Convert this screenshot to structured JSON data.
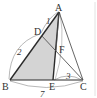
{
  "diagram": {
    "type": "geometry-triangle",
    "colors": {
      "line": "#2a2a2a",
      "thin_line": "#555555",
      "shade": "#d4d4d4",
      "arc": "#9a9a9a",
      "border": "#e2e2e2"
    },
    "points": {
      "A": {
        "label": "A",
        "x": 59,
        "y": 12
      },
      "B": {
        "label": "B",
        "x": 10,
        "y": 80
      },
      "C": {
        "label": "C",
        "x": 83,
        "y": 80
      },
      "D": {
        "label": "D",
        "x": 41,
        "y": 35
      },
      "E": {
        "label": "E",
        "x": 53,
        "y": 80
      },
      "F": {
        "label": "F",
        "x": 56,
        "y": 51
      }
    },
    "segment_labels": {
      "AD": "1",
      "DB": "2",
      "EC": "3",
      "BC": "7"
    },
    "shaded_region": "quadrilateral A-D-B-E (triangle ABE)"
  }
}
